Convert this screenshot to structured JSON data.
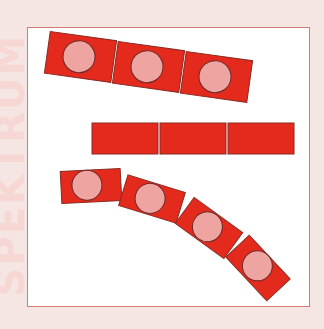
{
  "background_text": "SPEKTRUM",
  "colors": {
    "page_background": "#f5e6e4",
    "frame_border": "#d77a72",
    "frame_fill": "#ffffff",
    "block_fill": "#e42a1c",
    "block_stroke": "#8a2a22",
    "circle_fill": "#eea4a0",
    "circle_stroke": "#6e2a28",
    "gap": "#ffffff"
  },
  "figures": [
    {
      "name": "tilted-strip-with-circles",
      "blocks": 3,
      "has_circles": true,
      "shape": "slightly tilted straight"
    },
    {
      "name": "plain-strip",
      "blocks": 3,
      "has_circles": false,
      "shape": "straight horizontal"
    },
    {
      "name": "curved-strip-with-circles",
      "blocks": 4,
      "has_circles": true,
      "shape": "curved"
    }
  ]
}
